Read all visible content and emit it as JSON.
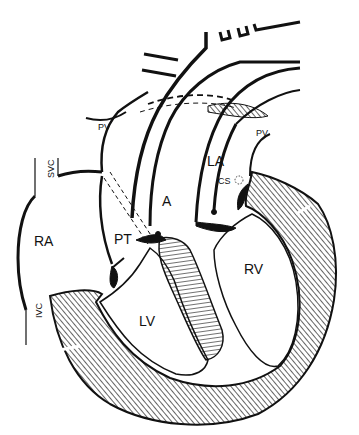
{
  "diagram": {
    "type": "anatomical line drawing",
    "colors": {
      "ink": "#111111",
      "background": "#ffffff"
    },
    "labels": {
      "ra": "RA",
      "la": "LA",
      "lv": "LV",
      "rv": "RV",
      "pt": "PT",
      "a": "A",
      "cs": "CS",
      "pv_left": "PV",
      "pv_right": "PV",
      "svc": "SVC",
      "ivc": "IVC"
    }
  }
}
